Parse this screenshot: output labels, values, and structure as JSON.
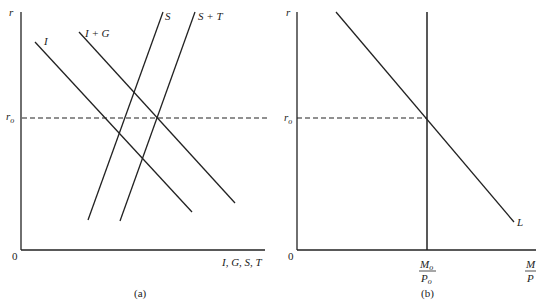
{
  "panel_a": {
    "caption": "(a)",
    "y_axis_label": "r",
    "x_axis_label": "I, G, S, T",
    "origin_label": "0",
    "ref_label": "r",
    "ref_label_sub": "o",
    "curves": [
      {
        "name": "I",
        "label": "I"
      },
      {
        "name": "I + G",
        "label": "I + G"
      },
      {
        "name": "S",
        "label": "S"
      },
      {
        "name": "S + T",
        "label": "S + T"
      }
    ]
  },
  "panel_b": {
    "caption": "(b)",
    "y_axis_label": "r",
    "origin_label": "0",
    "ref_label": "r",
    "ref_label_sub": "o",
    "supply_num": "M",
    "supply_num_sub": "o",
    "supply_den": "P",
    "supply_den_sub": "o",
    "x_num": "M",
    "x_den": "P",
    "curve_label": "L"
  },
  "colors": {
    "line": "#222222",
    "background": "#ffffff"
  }
}
